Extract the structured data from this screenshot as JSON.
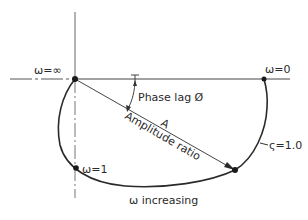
{
  "diagram": {
    "labels": {
      "omega_inf": "ω=∞",
      "omega_zero": "ω=0",
      "omega_one": "ω=1",
      "phase_lag": "Phase lag Ø",
      "amplitude_symbol": "A",
      "amplitude_ratio": "Amplitude ratio",
      "damping": "ς=1.0",
      "omega_increasing": "ω increasing"
    },
    "points": {
      "origin": {
        "label": "ω=∞",
        "x": 75,
        "y": 79
      },
      "omega_zero": {
        "label": "ω=0",
        "x": 264,
        "y": 79
      },
      "omega_one": {
        "label": "ω=1",
        "x": 76,
        "y": 168
      },
      "amplitude_end": {
        "x": 235,
        "y": 170
      }
    },
    "colors": {
      "line": "#2a2a2a",
      "axis": "#555555",
      "background": "#ffffff"
    }
  }
}
